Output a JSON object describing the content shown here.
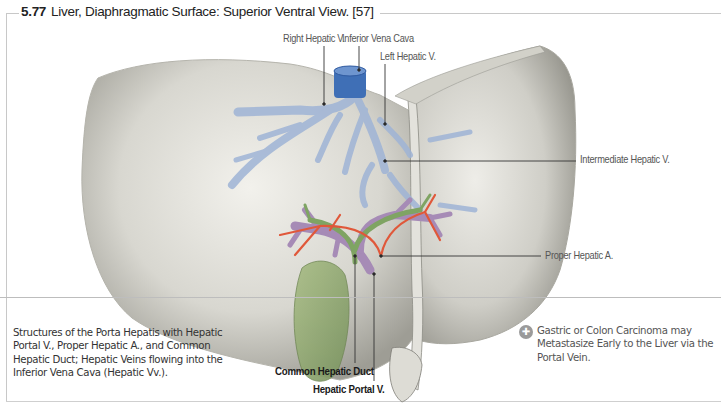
{
  "figure": {
    "number": "5.77",
    "title": "Liver, Diaphragmatic Surface: Superior Ventral View. [57]"
  },
  "labels": [
    {
      "id": "right-hepatic-v",
      "text": "Right Hepatic V.",
      "x": 283,
      "y": 32,
      "bold": false,
      "line": {
        "x1": 324,
        "y1": 46,
        "x2": 324,
        "y2": 104
      }
    },
    {
      "id": "inferior-vena-cava",
      "text": "Inferior Vena Cava",
      "x": 342,
      "y": 32,
      "bold": false,
      "line": {
        "x1": 359,
        "y1": 46,
        "x2": 359,
        "y2": 70
      }
    },
    {
      "id": "left-hepatic-v",
      "text": "Left Hepatic V.",
      "x": 380,
      "y": 50,
      "bold": false,
      "line": {
        "x1": 385,
        "y1": 64,
        "x2": 385,
        "y2": 124
      }
    },
    {
      "id": "intermediate-hepatic-v",
      "text": "Intermediate Hepatic V.",
      "x": 580,
      "y": 153,
      "bold": false,
      "line": {
        "x1": 385,
        "y1": 161,
        "x2": 576,
        "y2": 161
      }
    },
    {
      "id": "proper-hepatic-a",
      "text": "Proper Hepatic A.",
      "x": 545,
      "y": 249,
      "bold": false,
      "line": {
        "x1": 381,
        "y1": 256,
        "x2": 541,
        "y2": 256
      }
    },
    {
      "id": "common-hepatic-duct",
      "text": "Common Hepatic Duct",
      "x": 275,
      "y": 365,
      "bold": true,
      "line": {
        "x1": 355,
        "y1": 256,
        "x2": 355,
        "y2": 363
      }
    },
    {
      "id": "hepatic-portal-v",
      "text": "Hepatic Portal V.",
      "x": 313,
      "y": 383,
      "bold": true,
      "line": {
        "x1": 374,
        "y1": 274,
        "x2": 374,
        "y2": 381
      }
    }
  ],
  "caption": "Structures of the Porta Hepatis with Hepatic Portal V., Proper Hepatic A., and Common Hepatic Duct; Hepatic Veins  flowing into the Inferior Vena Cava (Hepatic Vv.).",
  "clinical_note": {
    "icon": "clinical-note-icon",
    "text": "Gastric or Colon Carcinoma may Metastasize Early to the Liver via the Portal Vein."
  },
  "colors": {
    "liver": "#d9d8d2",
    "liver_shadow": "#a9a89f",
    "vein_blue": "#9fb4d6",
    "ivc_blue": "#3f6fb6",
    "artery_red": "#e0583a",
    "portal_purple": "#a68bb6",
    "bile_green": "#8faa6e",
    "leader_line": "#333333"
  }
}
